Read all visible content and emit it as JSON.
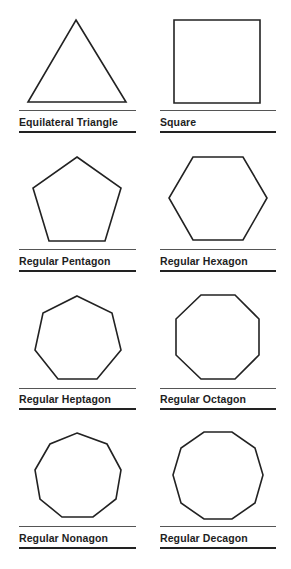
{
  "figure": {
    "title": "",
    "stroke_color": "#222222",
    "background": "#ffffff"
  },
  "shapes": [
    {
      "id": "triangle",
      "label": "Equilateral Triangle",
      "sides": 3,
      "column": 0,
      "row": 0,
      "points": "76,20 126,102 28,102"
    },
    {
      "id": "square",
      "label": "Square",
      "sides": 4,
      "column": 1,
      "row": 0,
      "points": "174,20 260,20 260,103 174,103"
    },
    {
      "id": "pentagon",
      "label": "Regular Pentagon",
      "sides": 5,
      "column": 0,
      "row": 1,
      "points": "77,157 121,188 105,241 49,241 33,188"
    },
    {
      "id": "hexagon",
      "label": "Regular Hexagon",
      "sides": 6,
      "column": 1,
      "row": 1,
      "points": "193,157 243,157 267,198 243,240 193,240 169,198"
    },
    {
      "id": "heptagon",
      "label": "Regular Heptagon",
      "sides": 7,
      "column": 0,
      "row": 2,
      "points": "77,296 112,313 121,350 97,379 58,379 35,350 43,313"
    },
    {
      "id": "octagon",
      "label": "Regular Octagon",
      "sides": 8,
      "column": 1,
      "row": 2,
      "points": "201,295 235,295 259,319 259,355 235,379 201,379 176,355 176,319"
    },
    {
      "id": "nonagon",
      "label": "Regular Nonagon",
      "sides": 9,
      "column": 0,
      "row": 3,
      "points": "77,433 107,444 121,470 116,499 93,517 62,517 40,499 35,470 50,444"
    },
    {
      "id": "decagon",
      "label": "Regular Decagon",
      "sides": 10,
      "column": 1,
      "row": 3,
      "points": "204,432 232,432 255,448 263,475 255,503 232,519 204,519 181,503 173,475 181,448"
    }
  ]
}
